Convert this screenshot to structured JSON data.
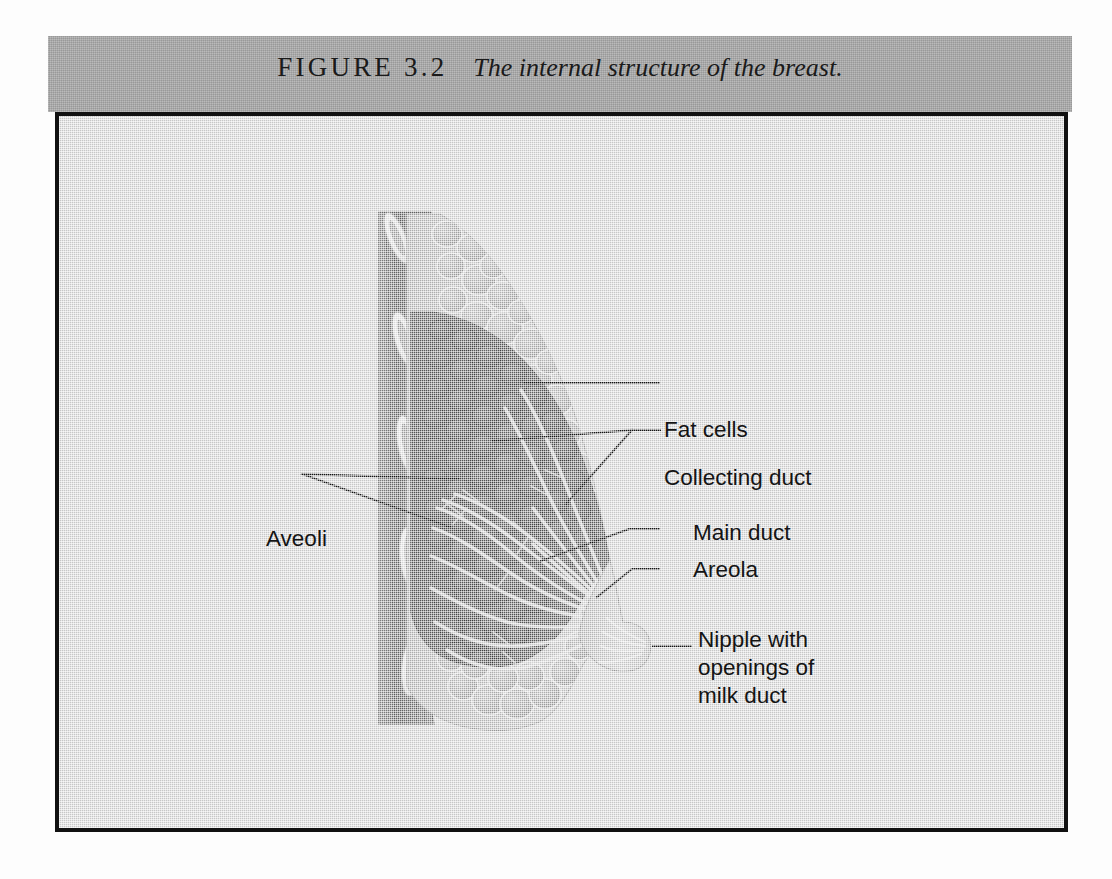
{
  "figure": {
    "label": "FIGURE 3.2",
    "title": "The internal structure of the breast."
  },
  "illustration": {
    "kind": "anatomical-cross-section",
    "subject": "internal structure of the breast",
    "view": "sagittal cross-section, facing right",
    "colors": {
      "page_background": "#fdfdfd",
      "caption_band": "#a9a9a9",
      "panel_background": "#d6d6d6",
      "panel_border": "#111111",
      "label_text": "#141414",
      "leader_line": "#151515",
      "chest_wall_muscle": "#6f6f6f",
      "rib_fill": "#e7e7e7",
      "fat_cell_fill": "#b0b0b0",
      "gland_lobule": "#5f5f5f",
      "duct_highlight": "#dcdcdc",
      "nipple": "#c9c9c9"
    },
    "structures": [
      {
        "name": "chest-wall-muscle",
        "description": "striated pectoral muscle layer at left"
      },
      {
        "name": "ribs",
        "count": 5,
        "description": "light oval rib cross-sections in the chest wall"
      },
      {
        "name": "fat-cells",
        "description": "rounded lobular fat cells filling the breast envelope"
      },
      {
        "name": "glandular-lobules",
        "description": "dark clustered alveolar lobules in the breast core"
      },
      {
        "name": "collecting-ducts",
        "description": "pale branching ducts radiating toward the nipple"
      },
      {
        "name": "main-ducts",
        "description": "larger ducts converging at the nipple"
      },
      {
        "name": "areola",
        "description": "pigmented skin surrounding the nipple"
      },
      {
        "name": "nipple",
        "description": "nipple with openings of the milk ducts"
      }
    ]
  },
  "labels": {
    "fat_cells": "Fat cells",
    "collecting_duct": "Collecting duct",
    "main_duct": "Main duct",
    "areola": "Areola",
    "nipple": "Nipple with\nopenings of\nmilk duct",
    "aveoli": "Aveoli"
  }
}
